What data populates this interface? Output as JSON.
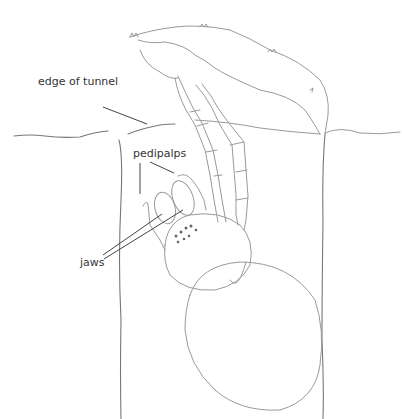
{
  "figure": {
    "labels": {
      "edge_of_tunnel": "edge of tunnel",
      "pedipalps": "pedipalps",
      "jaws": "jaws"
    },
    "colors": {
      "background": "#ffffff",
      "pencil": "#9a9a9a",
      "label_text": "#333333",
      "leader_line": "#444444"
    }
  }
}
